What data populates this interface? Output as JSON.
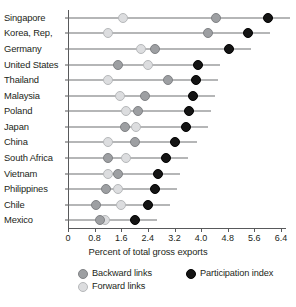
{
  "chart_data": {
    "type": "scatter",
    "title": "",
    "xlabel": "Percent of total gross exports",
    "ylabel": "",
    "xlim": [
      0,
      6.4
    ],
    "xticks": [
      "0",
      "0.8",
      "1.6",
      "2.4",
      "3.2",
      "4.0",
      "4.8",
      "5.6",
      "6.4"
    ],
    "xtick_values": [
      0,
      0.8,
      1.6,
      2.4,
      3.2,
      4.0,
      4.8,
      5.6,
      6.4
    ],
    "grid": false,
    "legend_position": "bottom",
    "categories": [
      "Singapore",
      "Korea, Rep,",
      "Germany",
      "United States",
      "Thailand",
      "Malaysia",
      "Poland",
      "Japan",
      "China",
      "South Africa",
      "Vietnam",
      "Philippines",
      "Chile",
      "Mexico"
    ],
    "series": [
      {
        "name": "Backward links",
        "color": "#9d9fa2",
        "values": [
          4.45,
          4.2,
          2.6,
          1.5,
          3.0,
          2.3,
          2.1,
          1.7,
          2.0,
          1.2,
          1.5,
          1.15,
          0.85,
          0.95
        ]
      },
      {
        "name": "Forward links",
        "color": "#dcdddf",
        "values": [
          1.65,
          1.2,
          2.2,
          2.4,
          1.2,
          1.55,
          1.75,
          2.05,
          1.2,
          1.75,
          1.2,
          1.5,
          1.6,
          1.1
        ]
      },
      {
        "name": "Participation index",
        "color": "#141414",
        "values": [
          6.0,
          5.4,
          4.85,
          3.9,
          3.85,
          3.75,
          3.65,
          3.55,
          3.2,
          2.95,
          2.7,
          2.6,
          2.4,
          2.0
        ]
      }
    ]
  }
}
